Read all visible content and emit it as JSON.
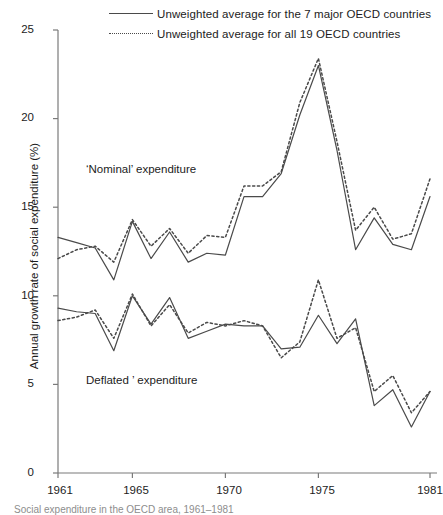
{
  "chart_data": {
    "type": "line",
    "title": "",
    "xlabel": "",
    "ylabel": "Annual growth rate of social expenditure (%)",
    "xlim": [
      1961,
      1981
    ],
    "ylim": [
      0,
      25
    ],
    "yticks": [
      0,
      5,
      10,
      15,
      20,
      25
    ],
    "xticks": [
      1961,
      1965,
      1970,
      1975,
      1981
    ],
    "grid": false,
    "legend_position": "top",
    "annotations": [
      {
        "text": "‘Nominal’ expenditure",
        "x": 1962.4,
        "y": 17.6
      },
      {
        "text": "Deflated ’ expenditure",
        "x": 1962.4,
        "y": 5.9
      }
    ],
    "x": [
      1961,
      1962,
      1963,
      1964,
      1965,
      1966,
      1967,
      1968,
      1969,
      1970,
      1971,
      1972,
      1973,
      1974,
      1975,
      1976,
      1977,
      1978,
      1979,
      1980,
      1981
    ],
    "series": [
      {
        "name": "Unweighted average for the 7 major OECD countries",
        "style": "solid",
        "group": "nominal",
        "values": [
          13.3,
          13.0,
          12.7,
          10.9,
          14.2,
          12.1,
          13.6,
          11.9,
          12.4,
          12.3,
          15.6,
          15.6,
          16.9,
          20.2,
          23.0,
          18.2,
          12.6,
          14.4,
          12.9,
          12.6,
          15.6
        ]
      },
      {
        "name": "Unweighted average for all 19 OECD countries",
        "style": "dotted",
        "group": "nominal",
        "values": [
          12.1,
          12.6,
          12.8,
          11.9,
          14.3,
          12.8,
          13.8,
          12.4,
          13.4,
          13.3,
          16.2,
          16.2,
          17.0,
          20.9,
          23.4,
          18.7,
          13.7,
          15.0,
          13.2,
          13.5,
          16.6
        ]
      },
      {
        "name": "Unweighted average for the 7 major OECD countries",
        "style": "solid",
        "group": "deflated",
        "values": [
          9.3,
          9.1,
          9.0,
          6.9,
          10.0,
          8.4,
          9.9,
          7.6,
          8.0,
          8.4,
          8.3,
          8.3,
          7.0,
          7.1,
          8.9,
          7.3,
          8.7,
          3.8,
          4.7,
          2.6,
          4.6
        ]
      },
      {
        "name": "Unweighted average for all 19 OECD countries",
        "style": "dotted",
        "group": "deflated",
        "values": [
          8.6,
          8.8,
          9.2,
          7.6,
          10.1,
          8.3,
          9.5,
          7.9,
          8.5,
          8.3,
          8.6,
          8.3,
          6.5,
          7.4,
          10.9,
          7.6,
          8.2,
          4.6,
          5.5,
          3.4,
          4.6
        ]
      }
    ]
  },
  "legend": {
    "entries": [
      {
        "label": "Unweighted average for the 7 major OECD countries",
        "style": "solid"
      },
      {
        "label": "Unweighted average for all 19 OECD countries",
        "style": "dotted"
      }
    ]
  },
  "axis": {
    "y_title": "Annual growth rate of social expenditure (%)",
    "y_tick_labels": [
      "25",
      "20",
      "15",
      "10",
      "5",
      "0"
    ],
    "x_tick_labels": [
      "1961",
      "1965",
      "1970",
      "1975",
      "1981"
    ]
  },
  "caption": "Social expenditure in the OECD area, 1961–1981",
  "colors": {
    "line": "#4a4a4a",
    "axis": "#7a7a7a",
    "text": "#1c1c1c"
  }
}
